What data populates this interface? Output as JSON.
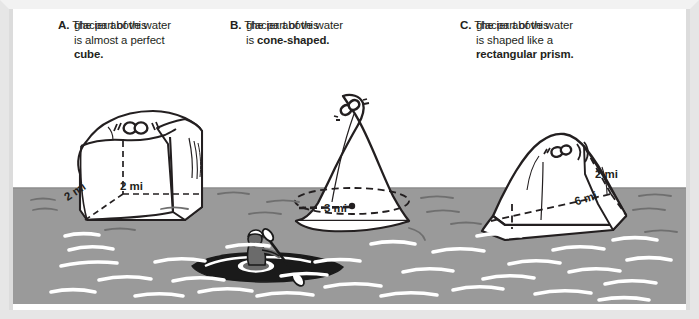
{
  "figure": {
    "type": "illustration"
  },
  "captions": [
    {
      "letter": "A.",
      "lines": [
        "The part of this",
        "glacier above water",
        "is almost a perfect"
      ],
      "bold_end": "cube."
    },
    {
      "letter": "B.",
      "lines": [
        "The part of this",
        "glacier above water"
      ],
      "lead": "is ",
      "bold_end": "cone-shaped."
    },
    {
      "letter": "C.",
      "lines": [
        "The part of this",
        "glacier above water",
        "is shaped like a"
      ],
      "bold_end": "rectangular prism."
    }
  ],
  "measurements": {
    "glacier_a": [
      {
        "value": "2 mi",
        "name": "cube-width-label"
      },
      {
        "value": "2 mi",
        "name": "cube-depth-label"
      }
    ],
    "glacier_b": [
      {
        "value": "3 mi",
        "name": "cone-radius-label"
      }
    ],
    "glacier_c": [
      {
        "value": "2 mi",
        "name": "prism-width-label"
      },
      {
        "value": "6 mi",
        "name": "prism-length-label"
      }
    ]
  },
  "scene": {
    "water_label": "water",
    "kayaker_label": "kayaker-in-kayak",
    "colors": {
      "water": "#9a9a9a",
      "wave": "#ffffff",
      "ice": "#ffffff",
      "outline": "#231f20",
      "ice_shadow": "#e8e8e8",
      "frame": "#e6e6e6",
      "text": "#231f20"
    }
  }
}
